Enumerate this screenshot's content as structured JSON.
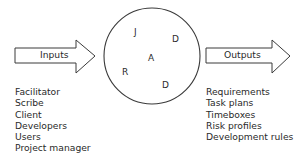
{
  "inputs": {
    "label": "Inputs",
    "items": [
      "Facilitator",
      "Scribe",
      "Client",
      "Developers",
      "Users",
      "Project manager"
    ]
  },
  "process": {
    "letters": [
      {
        "text": "J",
        "x": 134,
        "y": 27
      },
      {
        "text": "D",
        "x": 172,
        "y": 34
      },
      {
        "text": "A",
        "x": 148,
        "y": 53
      },
      {
        "text": "R",
        "x": 122,
        "y": 67
      },
      {
        "text": "D",
        "x": 162,
        "y": 80
      }
    ]
  },
  "outputs": {
    "label": "Outputs",
    "items": [
      "Requirements",
      "Task plans",
      "Timeboxes",
      "Risk profiles",
      "Development rules"
    ]
  },
  "colors": {
    "stroke": "#3a3a3a",
    "text": "#2a2a2a",
    "background": "#ffffff"
  }
}
